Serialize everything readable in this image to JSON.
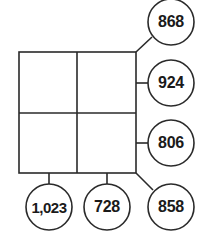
{
  "diagram": {
    "type": "grid-with-labeled-circles",
    "grid": {
      "rows": 2,
      "cols": 2
    },
    "circles": [
      {
        "id": "top-right-diagonal",
        "value": "868"
      },
      {
        "id": "right-row-1",
        "value": "924"
      },
      {
        "id": "right-row-2",
        "value": "806"
      },
      {
        "id": "bottom-col-1",
        "value": "1,023"
      },
      {
        "id": "bottom-col-2",
        "value": "728"
      },
      {
        "id": "bottom-right-diagonal",
        "value": "858"
      }
    ],
    "colors": {
      "line": "#2a2a2a",
      "text": "#1a1a1a",
      "background": "#ffffff"
    }
  }
}
